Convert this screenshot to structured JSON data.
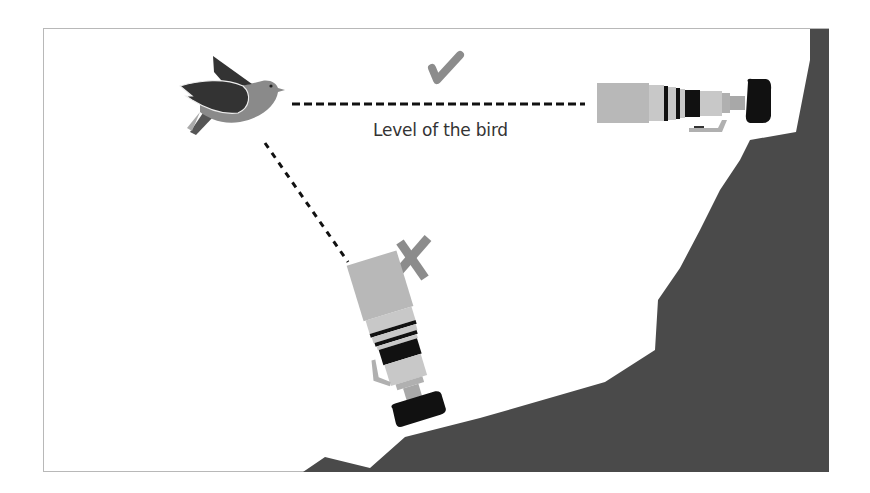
{
  "diagram": {
    "label": "Level of the bird",
    "correct_mark": "check-mark",
    "incorrect_mark": "x-mark",
    "elements": [
      {
        "name": "bird",
        "description": "flying bird at top left"
      },
      {
        "name": "camera-level",
        "description": "camera with telephoto lens on cliff, pointing horizontally at bird",
        "status": "correct"
      },
      {
        "name": "camera-low",
        "description": "camera with telephoto lens below, angled up toward bird",
        "status": "incorrect"
      },
      {
        "name": "cliff",
        "description": "dark gray cliff/hillside"
      }
    ],
    "colors": {
      "cliff": "#4a4a4a",
      "bird_body": "#8a8a8a",
      "bird_wing": "#333333",
      "lens_light": "#c8c8c8",
      "lens_mid": "#a8a8a8",
      "camera_body": "#111111",
      "mark": "#8c8c8c",
      "frame": "#b8b8b8"
    }
  }
}
